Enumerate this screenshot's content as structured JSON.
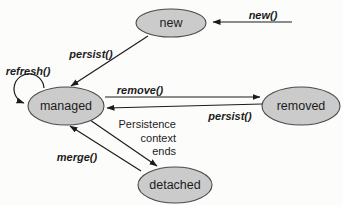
{
  "diagram": {
    "type": "state-diagram",
    "colors": {
      "background": "#fcfcfb",
      "state_fill": "#cbcbcb",
      "state_stroke": "#4a4a4a",
      "arrow": "#1c1c1c",
      "label": "#1c1c1c"
    },
    "states": {
      "new": {
        "label": "new"
      },
      "managed": {
        "label": "managed"
      },
      "removed": {
        "label": "removed"
      },
      "detached": {
        "label": "detached"
      }
    },
    "transitions": {
      "new_call": {
        "label": "new()",
        "from": "outside",
        "to": "new"
      },
      "persist_new": {
        "label": "persist()",
        "from": "new",
        "to": "managed"
      },
      "refresh": {
        "label": "refresh()",
        "from": "managed",
        "to": "managed"
      },
      "remove": {
        "label": "remove()",
        "from": "managed",
        "to": "removed"
      },
      "persist_removed": {
        "label": "persist()",
        "from": "removed",
        "to": "managed"
      },
      "context_ends": {
        "label_lines": [
          "Persistence",
          "context",
          "ends"
        ],
        "from": "managed",
        "to": "detached"
      },
      "merge": {
        "label": "merge()",
        "from": "detached",
        "to": "managed"
      }
    }
  }
}
